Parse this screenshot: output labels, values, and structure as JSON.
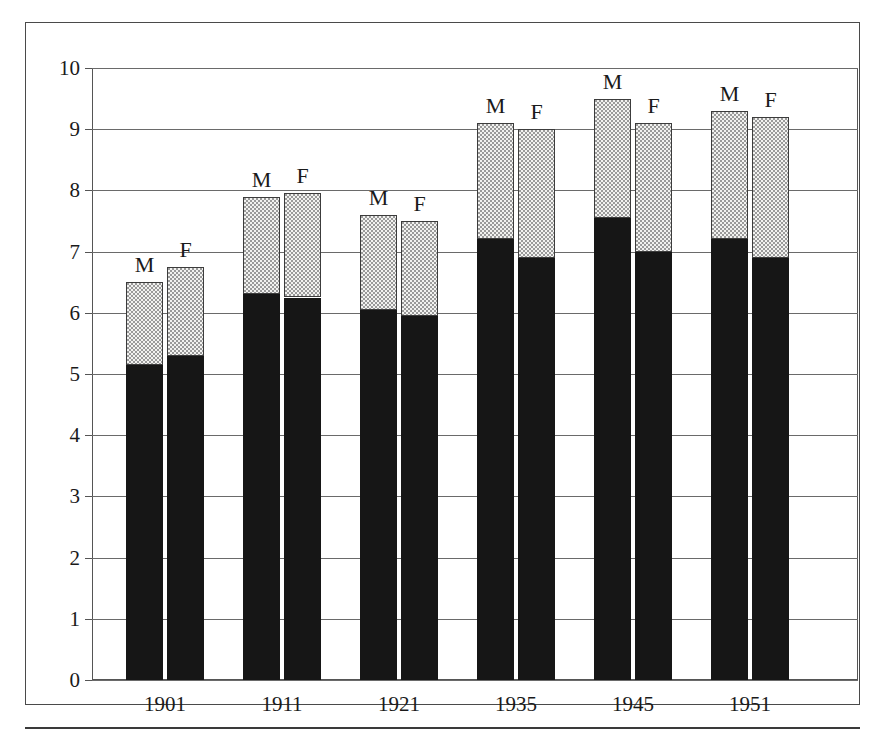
{
  "chart_data": {
    "type": "bar",
    "title": "",
    "subtitle": "",
    "xlabel": "",
    "ylabel": "",
    "ylim": [
      0,
      10
    ],
    "xlim_categories": [
      "1901",
      "1911",
      "1921",
      "1935",
      "1945",
      "1951"
    ],
    "categories": [
      "1901",
      "1911",
      "1921",
      "1935",
      "1945",
      "1951"
    ],
    "grid": true,
    "legend_position": "none",
    "stacked": true,
    "series_labels_above_bars": true,
    "yticks": [
      0,
      1,
      2,
      3,
      4,
      5,
      6,
      7,
      8,
      9,
      10
    ],
    "ytick_labels": [
      "0",
      "1",
      "2",
      "3",
      "4",
      "5",
      "6",
      "7",
      "8",
      "9",
      "10"
    ],
    "bar_group_labels": [
      "M",
      "F"
    ],
    "series": [
      {
        "name": "lower-segment-solid",
        "fill": "solid-black",
        "values_m": [
          5.15,
          6.3,
          6.05,
          7.2,
          7.55,
          7.2
        ],
        "values_f": [
          5.3,
          6.25,
          5.95,
          6.9,
          7.0,
          6.9
        ]
      },
      {
        "name": "upper-segment-stippled",
        "fill": "dotted-light",
        "values_m": [
          1.35,
          1.6,
          1.55,
          1.9,
          1.95,
          2.1
        ],
        "values_f": [
          1.45,
          1.7,
          1.55,
          2.1,
          2.1,
          2.3
        ]
      }
    ],
    "totals": {
      "M": [
        6.5,
        7.9,
        7.6,
        9.1,
        9.5,
        9.3
      ],
      "F": [
        6.75,
        7.95,
        7.5,
        9.0,
        9.1,
        9.2
      ]
    },
    "bars": [
      {
        "category": "1901",
        "sex": "M",
        "lower": 5.15,
        "total": 6.5,
        "label": "M"
      },
      {
        "category": "1901",
        "sex": "F",
        "lower": 5.3,
        "total": 6.75,
        "label": "F"
      },
      {
        "category": "1911",
        "sex": "M",
        "lower": 6.3,
        "total": 7.9,
        "label": "M"
      },
      {
        "category": "1911",
        "sex": "F",
        "lower": 6.25,
        "total": 7.95,
        "label": "F"
      },
      {
        "category": "1921",
        "sex": "M",
        "lower": 6.05,
        "total": 7.6,
        "label": "M"
      },
      {
        "category": "1921",
        "sex": "F",
        "lower": 5.95,
        "total": 7.5,
        "label": "F"
      },
      {
        "category": "1935",
        "sex": "M",
        "lower": 7.2,
        "total": 9.1,
        "label": "M"
      },
      {
        "category": "1935",
        "sex": "F",
        "lower": 6.9,
        "total": 9.0,
        "label": "F"
      },
      {
        "category": "1945",
        "sex": "M",
        "lower": 7.55,
        "total": 9.5,
        "label": "M"
      },
      {
        "category": "1945",
        "sex": "F",
        "lower": 7.0,
        "total": 9.1,
        "label": "F"
      },
      {
        "category": "1951",
        "sex": "M",
        "lower": 7.2,
        "total": 9.3,
        "label": "M"
      },
      {
        "category": "1951",
        "sex": "F",
        "lower": 6.9,
        "total": 9.2,
        "label": "F"
      }
    ],
    "colors": {
      "lower_segment": "#161616",
      "upper_segment_fill": "#f2f2f0",
      "upper_segment_dots": "#9a9a9a",
      "outline": "#3c3c3c",
      "gridline": "#6a6a6a",
      "frame": "#4a4a4a",
      "text": "#1a1a1a",
      "background": "#ffffff"
    }
  }
}
